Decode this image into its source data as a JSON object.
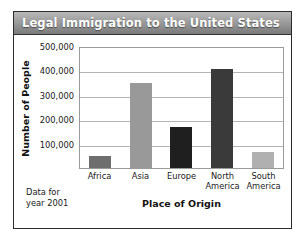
{
  "figure": {
    "title": "Legal Immigration to the United States",
    "footnote_line1": "Data for",
    "footnote_line2": "year 2001"
  },
  "chart_data": {
    "type": "bar",
    "title": "Legal Immigration to the United States",
    "xlabel": "Place of Origin",
    "ylabel": "Number of People",
    "categories": [
      "Africa",
      "Asia",
      "Europe",
      "North America",
      "South America"
    ],
    "category_lines": [
      [
        "Africa"
      ],
      [
        "Asia"
      ],
      [
        "Europe"
      ],
      [
        "North",
        "America"
      ],
      [
        "South",
        "America"
      ]
    ],
    "values": [
      50000,
      350000,
      170000,
      405000,
      65000
    ],
    "bar_colors": [
      "#6e6e6e",
      "#999999",
      "#1f1f1f",
      "#3a3a3a",
      "#b0b0b0"
    ],
    "ylim": [
      0,
      500000
    ],
    "yticks": [
      100000,
      200000,
      300000,
      400000,
      500000
    ],
    "ytick_labels": [
      "100,000",
      "200,000",
      "300,000",
      "400,000",
      "500,000"
    ],
    "grid": true,
    "legend": "none",
    "annotation": "Data for year 2001"
  }
}
